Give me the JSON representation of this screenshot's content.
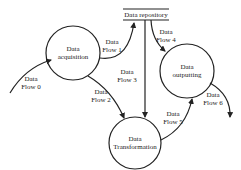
{
  "diagram": {
    "type": "data-flow-diagram",
    "processes": [
      {
        "id": "acquisition",
        "line1": "Data",
        "line2": "acquisition"
      },
      {
        "id": "outputting",
        "line1": "Data",
        "line2": "outputting"
      },
      {
        "id": "transformation",
        "line1": "Data",
        "line2": "Transformation"
      }
    ],
    "store": {
      "id": "repository",
      "label": "Data repository"
    },
    "flows": [
      {
        "id": "flow0",
        "line1": "Data",
        "line2": "Flow 0",
        "from": "external",
        "to": "acquisition"
      },
      {
        "id": "flow1",
        "line1": "Data",
        "line2": "Flow 1",
        "from": "acquisition",
        "to": "repository"
      },
      {
        "id": "flow2",
        "line1": "Data",
        "line2": "Flow 2",
        "from": "acquisition",
        "to": "transformation"
      },
      {
        "id": "flow3",
        "line1": "Data",
        "line2": "Flow 3",
        "from": "repository",
        "to": "transformation"
      },
      {
        "id": "flow4",
        "line1": "Data",
        "line2": "Flow 4",
        "from": "repository",
        "to": "outputting"
      },
      {
        "id": "flow5",
        "line1": "Data",
        "line2": "Flow 5",
        "from": "transformation",
        "to": "outputting"
      },
      {
        "id": "flow6",
        "line1": "Data",
        "line2": "Flow 6",
        "from": "outputting",
        "to": "external"
      }
    ],
    "colors": {
      "stroke": "#222222",
      "background": "#ffffff"
    }
  }
}
